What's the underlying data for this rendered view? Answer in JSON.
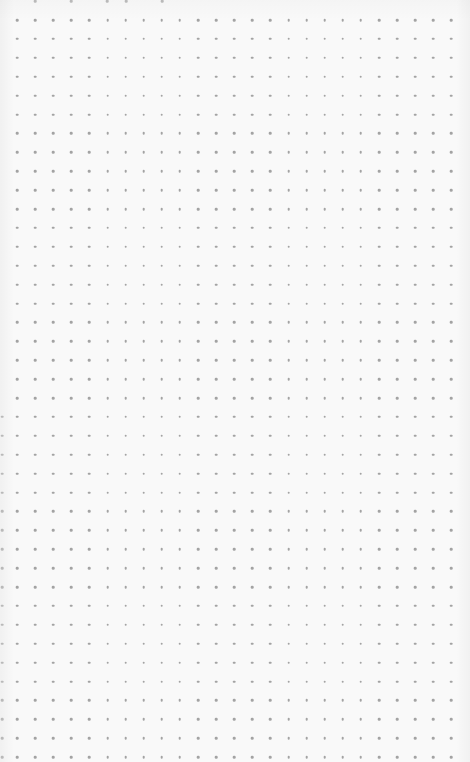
{
  "page": {
    "type": "dot-grid-paper",
    "background_color": "#f9f9f9",
    "dot_color": "#a3a3a3"
  },
  "grid": {
    "origin_x": 17,
    "origin_y": 20,
    "step_x": 18.1,
    "step_y": 18.9,
    "columns": 25,
    "rows": 40,
    "partial_top_row": {
      "y": 1,
      "xs": [
        35,
        71,
        107,
        126,
        162
      ]
    },
    "partial_left_column": {
      "x": 2,
      "y_from": 400,
      "y_to": 762
    }
  }
}
